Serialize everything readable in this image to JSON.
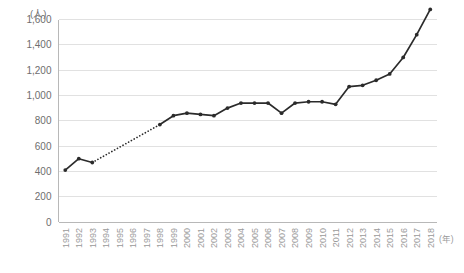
{
  "chart_data": {
    "type": "line",
    "title": "",
    "subtitle": "",
    "xlabel": "(年)",
    "ylabel": "(人)",
    "ylim": [
      0,
      1600
    ],
    "ytick_step": 200,
    "ytick_labels": [
      "0",
      "200",
      "400",
      "600",
      "800",
      "1,000",
      "1,200",
      "1,400",
      "1,600"
    ],
    "ytick_values": [
      0,
      200,
      400,
      600,
      800,
      1000,
      1200,
      1400,
      1600
    ],
    "grid": true,
    "grid_axis": "y",
    "legend": false,
    "legend_position": "none",
    "marker": "circle",
    "line_color": "#2b2b2b",
    "grid_color": "#d9d9d9",
    "axis_color": "#b0b0b0",
    "label_color": "#9a9a9a",
    "categories": [
      "1991",
      "1992",
      "1993",
      "1994",
      "1995",
      "1996",
      "1997",
      "1998",
      "1999",
      "2000",
      "2001",
      "2002",
      "2003",
      "2004",
      "2005",
      "2006",
      "2007",
      "2008",
      "2009",
      "2010",
      "2011",
      "2012",
      "2013",
      "2014",
      "2015",
      "2016",
      "2017",
      "2018"
    ],
    "values": [
      410,
      500,
      470,
      null,
      null,
      null,
      null,
      770,
      840,
      860,
      850,
      840,
      900,
      940,
      940,
      940,
      860,
      940,
      950,
      950,
      930,
      1070,
      1080,
      1120,
      1170,
      1300,
      1480,
      1680
    ],
    "interpolated_segment": {
      "from_category": "1993",
      "to_category": "1998",
      "style": "dotted",
      "note": "missing data shown as dotted connector"
    },
    "annotations": []
  }
}
